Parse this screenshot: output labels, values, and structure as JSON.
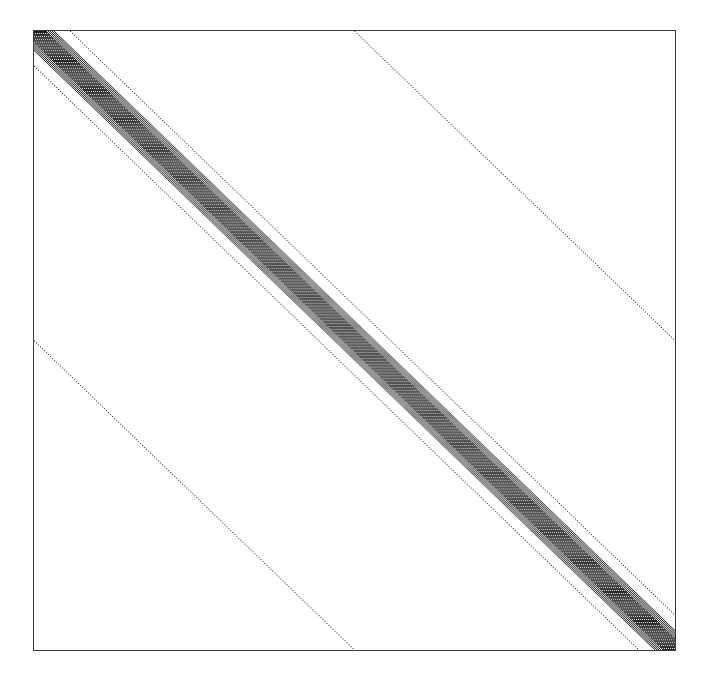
{
  "figure": {
    "kind": "matrix-sparsity-pattern",
    "title": "",
    "background_color": "#ffffff",
    "marker_color": "#1a1a1a",
    "axes": {
      "frame_color": "#3a3a3a",
      "frame_line_width_px": 1.3,
      "left_px": 33,
      "top_px": 30,
      "width_px": 643,
      "height_px": 621,
      "x_tick_labels": [],
      "y_tick_labels": [],
      "grid": false,
      "xlabel": "",
      "ylabel": ""
    }
  },
  "chart_data": {
    "type": "scatter",
    "title": "",
    "subtitle": "",
    "xlabel": "",
    "ylabel": "",
    "grid": false,
    "legend": [],
    "plot_style": "spy",
    "matrix": {
      "rows": 640,
      "columns": 640,
      "orientation": "row-index increases downward, column-index increases rightward",
      "main_diagonal_direction": "top-left to bottom-right"
    },
    "xlim": [
      0,
      640
    ],
    "ylim": [
      640,
      0
    ],
    "diagonal_bands": [
      {
        "name": "main-dense-band",
        "offset_low": -21,
        "offset_high": 21,
        "fill": "dense-checker",
        "density": 0.55,
        "color": "#1a1a1a"
      },
      {
        "name": "upper-thin-diagonal",
        "offset_low": 36,
        "offset_high": 36,
        "fill": "dotted",
        "density": 0.5,
        "color": "#1a1a1a"
      },
      {
        "name": "lower-thin-diagonal",
        "offset_low": -36,
        "offset_high": -36,
        "fill": "dotted",
        "density": 0.5,
        "color": "#1a1a1a"
      },
      {
        "name": "upper-far-diagonal",
        "offset_low": 320,
        "offset_high": 320,
        "fill": "dotted",
        "density": 0.5,
        "color": "#1a1a1a"
      },
      {
        "name": "lower-far-diagonal",
        "offset_low": -320,
        "offset_high": -320,
        "fill": "dotted",
        "density": 0.5,
        "color": "#1a1a1a"
      }
    ],
    "annotations": []
  }
}
